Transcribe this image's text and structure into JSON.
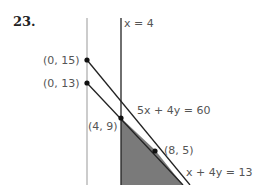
{
  "problem_number": "23.",
  "lines": {
    "vertical_line_label": "x = 4",
    "line1_label": "5x + 4y = 60",
    "line2_label": "x + 4y = 13"
  },
  "points": [
    {
      "label": "(0, 15)"
    },
    {
      "label": "(0, 13)"
    },
    {
      "label": "(4, 9)"
    },
    {
      "label": "(8, 5)"
    }
  ],
  "colors": {
    "shading": "#7a7a7a",
    "axis": "#999999",
    "line": "#222222",
    "label": "#555555"
  }
}
